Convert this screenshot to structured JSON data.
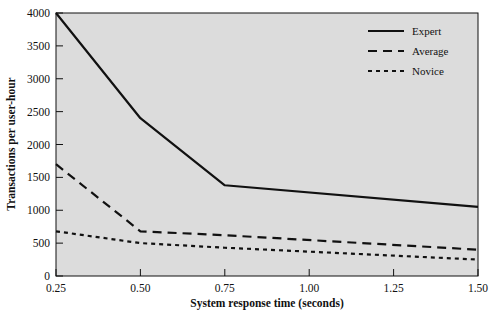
{
  "chart_data": {
    "type": "line",
    "title": "",
    "xlabel": "System response time (seconds)",
    "ylabel": "Transactions per user-hour",
    "xlim": [
      0.25,
      1.5
    ],
    "ylim": [
      0,
      4000
    ],
    "xticks": [
      "0.25",
      "0.50",
      "0.75",
      "1.00",
      "1.25",
      "1.50"
    ],
    "xtick_values": [
      0.25,
      0.5,
      0.75,
      1.0,
      1.25,
      1.5
    ],
    "yticks": [
      "0",
      "500",
      "1000",
      "1500",
      "2000",
      "2500",
      "3000",
      "3500",
      "4000"
    ],
    "ytick_values": [
      0,
      500,
      1000,
      1500,
      2000,
      2500,
      3000,
      3500,
      4000
    ],
    "grid": false,
    "legend_position": "top-right",
    "plot_background": "#dcdcdc",
    "page_background": "#ffffff",
    "line_color": "#111111",
    "x": [
      0.25,
      0.5,
      0.75,
      1.5
    ],
    "series": [
      {
        "name": "Expert",
        "style": "solid",
        "dasharray": "",
        "width": 2.2,
        "x": [
          0.25,
          0.5,
          0.75,
          1.5
        ],
        "values": [
          4000,
          2400,
          1380,
          1050
        ]
      },
      {
        "name": "Average",
        "style": "dashed",
        "dasharray": "9,6",
        "width": 2.2,
        "x": [
          0.25,
          0.5,
          0.75,
          1.5
        ],
        "values": [
          1700,
          680,
          620,
          400
        ]
      },
      {
        "name": "Novice",
        "style": "dotted",
        "dasharray": "4,4",
        "width": 2.2,
        "x": [
          0.25,
          0.5,
          0.75,
          1.5
        ],
        "values": [
          680,
          500,
          430,
          250
        ]
      }
    ]
  },
  "legend": {
    "entries": [
      {
        "label": "Expert"
      },
      {
        "label": "Average"
      },
      {
        "label": "Novice"
      }
    ]
  },
  "axes": {
    "x_title": "System response time (seconds)",
    "y_title": "Transactions per user-hour"
  }
}
